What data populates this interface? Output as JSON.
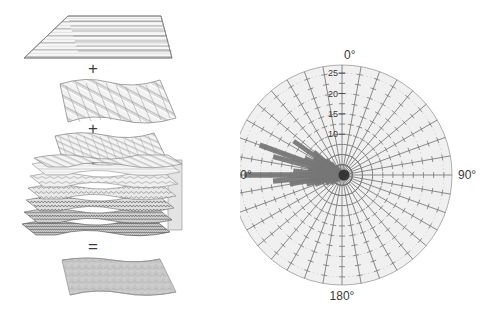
{
  "figure": {
    "panels": [
      "layer-decomposition",
      "polar-rose-plot"
    ]
  },
  "left_panel": {
    "name": "layer-decomposition-diagram",
    "operators": [
      {
        "symbol": "+",
        "x": 93,
        "y": 68
      },
      {
        "symbol": "+",
        "x": 93,
        "y": 128
      },
      {
        "symbol": "+",
        "x": 93,
        "y": 162
      },
      {
        "symbol": "=",
        "x": 93,
        "y": 247
      }
    ],
    "layers": [
      {
        "id": "layer-1",
        "pattern": "horizontal-corrugation",
        "wavelength": "coarse",
        "fill": "#f2f2f2"
      },
      {
        "id": "layer-2",
        "pattern": "diagonal-corrugation",
        "wavelength": "medium",
        "fill": "#ededed"
      },
      {
        "id": "layer-3",
        "pattern": "diagonal-corrugation",
        "wavelength": "fine",
        "fill": "#f0f0f0"
      },
      {
        "id": "stack",
        "pattern": "multi-layer-stack",
        "wavelength": "increasing",
        "fill": "#eeeeee"
      },
      {
        "id": "result",
        "pattern": "composite-rough-surface",
        "wavelength": "mixed",
        "fill": "#c9c9c9"
      }
    ]
  },
  "chart_data": {
    "type": "polar-rose",
    "title": "",
    "xlabel": "",
    "ylabel": "",
    "angle_unit": "degrees",
    "angle_labels": [
      "0°",
      "90°",
      "180°",
      "270°"
    ],
    "angle_label_values": [
      0,
      90,
      180,
      270
    ],
    "spoke_count": 36,
    "spoke_step_deg": 10,
    "radial_ticks": [
      10,
      15,
      20,
      25
    ],
    "radial_tick_labels": [
      "10",
      "15",
      "20",
      "25"
    ],
    "rlim": [
      0,
      27
    ],
    "radial_tick_interval": 2.5,
    "grid": true,
    "legend": "none",
    "background_fill": "#f0f0f0",
    "outline_color": "#9a9a9a",
    "spoke_color": "#6e6e6e",
    "data_color": "#767676",
    "series": [
      {
        "name": "orientation-magnitude",
        "points": [
          {
            "angle": 0,
            "value": 0.9,
            "width": 2.0
          },
          {
            "angle": 10,
            "value": 0.8,
            "width": 2.0
          },
          {
            "angle": 20,
            "value": 0.8,
            "width": 2.0
          },
          {
            "angle": 30,
            "value": 0.7,
            "width": 2.0
          },
          {
            "angle": 40,
            "value": 0.7,
            "width": 2.0
          },
          {
            "angle": 50,
            "value": 0.8,
            "width": 2.0
          },
          {
            "angle": 60,
            "value": 0.9,
            "width": 2.0
          },
          {
            "angle": 70,
            "value": 1.0,
            "width": 2.0
          },
          {
            "angle": 80,
            "value": 1.1,
            "width": 2.0
          },
          {
            "angle": 90,
            "value": 1.6,
            "width": 2.2
          },
          {
            "angle": 100,
            "value": 1.1,
            "width": 2.0
          },
          {
            "angle": 110,
            "value": 1.0,
            "width": 2.0
          },
          {
            "angle": 120,
            "value": 0.9,
            "width": 2.0
          },
          {
            "angle": 130,
            "value": 0.8,
            "width": 2.0
          },
          {
            "angle": 140,
            "value": 0.8,
            "width": 2.0
          },
          {
            "angle": 150,
            "value": 0.7,
            "width": 2.0
          },
          {
            "angle": 160,
            "value": 0.7,
            "width": 2.0
          },
          {
            "angle": 170,
            "value": 0.8,
            "width": 2.0
          },
          {
            "angle": 180,
            "value": 0.9,
            "width": 2.0
          },
          {
            "angle": 190,
            "value": 1.0,
            "width": 2.0
          },
          {
            "angle": 200,
            "value": 1.3,
            "width": 2.2
          },
          {
            "angle": 210,
            "value": 1.7,
            "width": 2.4
          },
          {
            "angle": 220,
            "value": 2.3,
            "width": 2.8
          },
          {
            "angle": 230,
            "value": 3.4,
            "width": 3.2
          },
          {
            "angle": 240,
            "value": 4.5,
            "width": 3.6
          },
          {
            "angle": 250,
            "value": 7.0,
            "width": 4.2
          },
          {
            "angle": 255,
            "value": 9.0,
            "width": 4.4
          },
          {
            "angle": 260,
            "value": 13.0,
            "width": 4.8
          },
          {
            "angle": 265,
            "value": 17.0,
            "width": 5.2
          },
          {
            "angle": 270,
            "value": 24.0,
            "width": 5.4
          },
          {
            "angle": 275,
            "value": 12.0,
            "width": 4.6
          },
          {
            "angle": 280,
            "value": 8.5,
            "width": 4.2
          },
          {
            "angle": 285,
            "value": 17.5,
            "width": 5.0
          },
          {
            "angle": 290,
            "value": 21.5,
            "width": 5.2
          },
          {
            "angle": 295,
            "value": 10.0,
            "width": 4.2
          },
          {
            "angle": 300,
            "value": 8.0,
            "width": 3.8
          },
          {
            "angle": 305,
            "value": 14.5,
            "width": 4.6
          },
          {
            "angle": 310,
            "value": 9.0,
            "width": 3.8
          },
          {
            "angle": 315,
            "value": 5.5,
            "width": 3.4
          },
          {
            "angle": 320,
            "value": 4.0,
            "width": 3.0
          },
          {
            "angle": 330,
            "value": 2.6,
            "width": 2.6
          },
          {
            "angle": 340,
            "value": 1.8,
            "width": 2.3
          },
          {
            "angle": 350,
            "value": 1.2,
            "width": 2.0
          }
        ]
      }
    ],
    "center_px": {
      "x": 342,
      "y": 175
    },
    "radius_px": 110
  }
}
